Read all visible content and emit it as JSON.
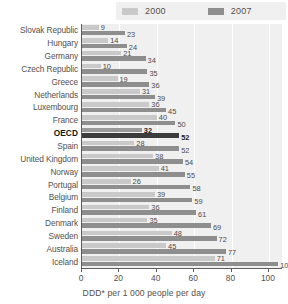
{
  "legend": {
    "entries": [
      {
        "label": "2000",
        "color": "#c9c9c9"
      },
      {
        "label": "2007",
        "color": "#8e8e8e"
      }
    ]
  },
  "axis": {
    "caption": "DDD* per 1 000 people per day",
    "ticks": [
      "0",
      "20",
      "40",
      "60",
      "80",
      "100"
    ]
  },
  "chart_data": {
    "type": "bar",
    "orientation": "horizontal",
    "title": "",
    "subtitle": "",
    "xlabel": "DDD* per 1 000 people per day",
    "ylabel": "",
    "xlim": [
      0,
      107
    ],
    "grid": true,
    "legend_position": "top",
    "xticks": [
      0,
      20,
      40,
      60,
      80,
      100
    ],
    "categories": [
      "Slovak Republic",
      "Hungary",
      "Germany",
      "Czech Republic",
      "Greece",
      "Netherlands",
      "Luxembourg",
      "France",
      "OECD",
      "Spain",
      "United Kingdom",
      "Norway",
      "Portugal",
      "Belgium",
      "Finland",
      "Denmark",
      "Sweden",
      "Australia",
      "Iceland"
    ],
    "highlight_category": "OECD",
    "series": [
      {
        "name": "2000",
        "color": "#c9c9c9",
        "values": [
          9,
          14,
          21,
          10,
          19,
          31,
          36,
          40,
          32,
          28,
          38,
          41,
          26,
          39,
          36,
          35,
          48,
          45,
          71
        ]
      },
      {
        "name": "2007",
        "color": "#8e8e8e",
        "values": [
          23,
          24,
          34,
          35,
          36,
          39,
          45,
          50,
          52,
          52,
          54,
          55,
          58,
          59,
          61,
          69,
          72,
          77,
          105
        ]
      }
    ]
  }
}
